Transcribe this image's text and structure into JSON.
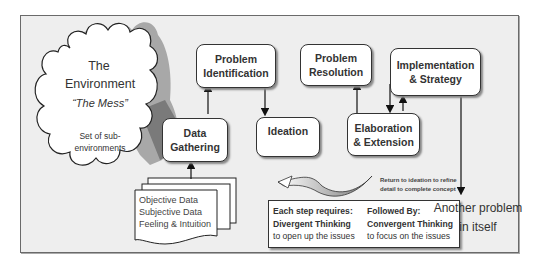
{
  "cloud": {
    "title_line1": "The",
    "title_line2": "Environment",
    "subtitle": "“The Mess”",
    "desc_line1": "Set of sub-",
    "desc_line2": "environments"
  },
  "steps": {
    "data_gathering": {
      "line1": "Data",
      "line2": "Gathering"
    },
    "problem_identification": {
      "line1": "Problem",
      "line2": "Identification"
    },
    "ideation": {
      "line1": "Ideation"
    },
    "problem_resolution": {
      "line1": "Problem",
      "line2": "Resolution"
    },
    "elaboration_extension": {
      "line1": "Elaboration",
      "line2": "& Extension"
    },
    "implementation_strategy": {
      "line1": "Implementation",
      "line2": "& Strategy"
    }
  },
  "documents": {
    "items": [
      "Objective Data",
      "Subjective Data",
      "Feeling & Intuition"
    ]
  },
  "return_note": {
    "line1": "Return to ideation to refine",
    "line2": "detail to complete concept"
  },
  "thinking_box": {
    "left": {
      "line1": "Each step requires:",
      "line2": "Divergent Thinking",
      "line3": "to open up the issues"
    },
    "right": {
      "line1": "Followed By:",
      "line2": "Convergent Thinking",
      "line3": "to focus on the issues"
    }
  },
  "outcome": {
    "line1": "Another problem",
    "line2": "in itself"
  },
  "colors": {
    "frame_bg": "#eeeeee",
    "box_border": "#333333",
    "shadow_gray": "#9a9a9a",
    "dark_shadow": "#7a7a7a"
  }
}
